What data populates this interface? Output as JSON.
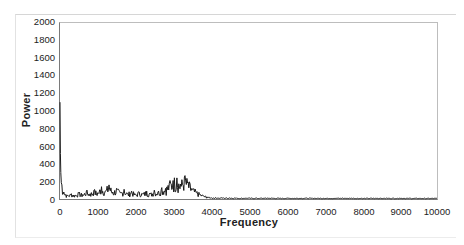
{
  "chart_data": {
    "type": "line",
    "title": "",
    "xlabel": "Frequency",
    "ylabel": "Power",
    "xlim": [
      0,
      10000
    ],
    "ylim": [
      0,
      2000
    ],
    "grid": false,
    "legend": null,
    "x_ticks": [
      "0",
      "1000",
      "2000",
      "3000",
      "4000",
      "5000",
      "6000",
      "7000",
      "8000",
      "9000",
      "10000"
    ],
    "y_ticks": [
      "0",
      "200",
      "400",
      "600",
      "800",
      "1000",
      "1200",
      "1400",
      "1600",
      "1800",
      "2000"
    ],
    "series": [
      {
        "name": "Power spectrum",
        "color": "#1a1a1a",
        "x": [
          0,
          20,
          50,
          100,
          150,
          200,
          300,
          400,
          500,
          600,
          700,
          800,
          900,
          1000,
          1100,
          1200,
          1300,
          1400,
          1500,
          1600,
          1700,
          1800,
          1900,
          2000,
          2100,
          2200,
          2300,
          2400,
          2500,
          2600,
          2700,
          2800,
          2900,
          3000,
          3100,
          3200,
          3300,
          3400,
          3500,
          3600,
          3700,
          3800,
          3900,
          4000,
          4500,
          5000,
          5500,
          6000,
          6500,
          7000,
          7500,
          8000,
          8500,
          9000,
          9500,
          10000
        ],
        "values": [
          1100,
          300,
          160,
          80,
          50,
          40,
          60,
          45,
          70,
          50,
          90,
          60,
          100,
          70,
          140,
          90,
          160,
          80,
          120,
          70,
          110,
          60,
          90,
          50,
          80,
          60,
          90,
          60,
          100,
          80,
          130,
          120,
          180,
          210,
          240,
          170,
          250,
          190,
          120,
          90,
          60,
          40,
          25,
          15,
          12,
          10,
          10,
          9,
          10,
          9,
          10,
          8,
          9,
          9,
          8,
          8
        ]
      }
    ]
  }
}
